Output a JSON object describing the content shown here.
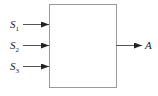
{
  "diagram": {
    "type": "block",
    "block": {
      "x": 49,
      "y": 4,
      "width": 67,
      "height": 83,
      "stroke": "#9a9a9a"
    },
    "inputs": [
      {
        "base": "S",
        "sub": "1",
        "y": 24
      },
      {
        "base": "S",
        "sub": "2",
        "y": 45
      },
      {
        "base": "S",
        "sub": "3",
        "y": 66
      }
    ],
    "output": {
      "label": "A",
      "y": 45
    },
    "colors": {
      "arrow": "#222222",
      "line": "#555555"
    }
  }
}
